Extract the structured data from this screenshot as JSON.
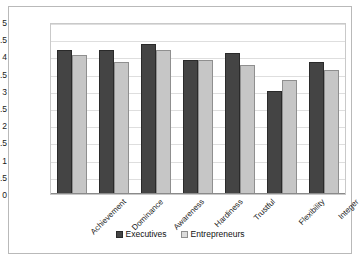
{
  "chart_data": {
    "type": "bar",
    "title": "",
    "xlabel": "",
    "ylabel": "",
    "ylim": [
      0,
      5
    ],
    "ytick_step": 0.5,
    "yticks": [
      "0",
      "0.5",
      "1",
      "1.5",
      "2",
      "2.5",
      "3",
      "3.5",
      "4",
      "4.5",
      "5"
    ],
    "grid": true,
    "legend_position": "bottom",
    "categories": [
      "Achievement",
      "Dominance",
      "Awareness",
      "Hardiness",
      "Trustful",
      "Flexibility",
      "Integer"
    ],
    "series": [
      {
        "name": "Executives",
        "color": "#444444",
        "values": [
          4.2,
          4.2,
          4.35,
          3.9,
          4.1,
          3.0,
          3.85
        ]
      },
      {
        "name": "Entrepreneurs",
        "color": "#c6c6c6",
        "values": [
          4.05,
          3.85,
          4.2,
          3.9,
          3.75,
          3.3,
          3.6
        ]
      }
    ]
  }
}
